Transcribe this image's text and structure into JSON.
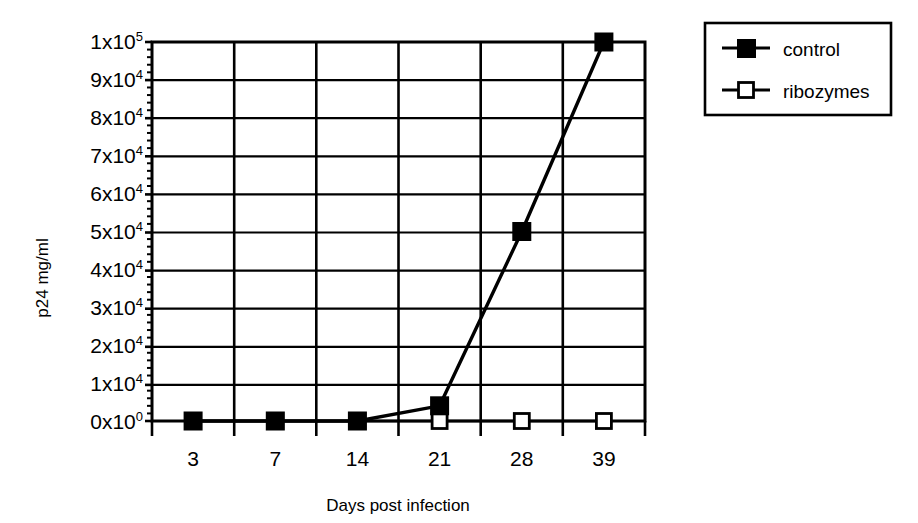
{
  "chart_data": {
    "type": "line",
    "title": "",
    "subtitle": "",
    "xlabel": "Days post infection",
    "ylabel": "p24 mg/ml",
    "categories": [
      "3",
      "7",
      "14",
      "21",
      "28",
      "39"
    ],
    "x": [
      3,
      7,
      14,
      21,
      28,
      39
    ],
    "series": [
      {
        "name": "control",
        "marker": "filled-square",
        "color": "#000000",
        "values": [
          0,
          0,
          0,
          4000,
          50000,
          100000
        ]
      },
      {
        "name": "ribozymes",
        "marker": "open-square",
        "color": "#000000",
        "values": [
          0,
          0,
          0,
          0,
          0,
          0
        ]
      }
    ],
    "ylim": [
      0,
      100000
    ],
    "ytick_values": [
      0,
      10000,
      20000,
      30000,
      40000,
      50000,
      60000,
      70000,
      80000,
      90000,
      100000
    ],
    "ytick_labels": [
      {
        "mantissa": "0x10",
        "exponent": "0"
      },
      {
        "mantissa": "1x10",
        "exponent": "4"
      },
      {
        "mantissa": "2x10",
        "exponent": "4"
      },
      {
        "mantissa": "3x10",
        "exponent": "4"
      },
      {
        "mantissa": "4x10",
        "exponent": "4"
      },
      {
        "mantissa": "5x10",
        "exponent": "4"
      },
      {
        "mantissa": "6x10",
        "exponent": "4"
      },
      {
        "mantissa": "7x10",
        "exponent": "4"
      },
      {
        "mantissa": "8x10",
        "exponent": "4"
      },
      {
        "mantissa": "9x10",
        "exponent": "4"
      },
      {
        "mantissa": "1x10",
        "exponent": "5"
      }
    ],
    "minor_tick_step": 2000,
    "grid": {
      "horizontal": true,
      "vertical": true
    },
    "legend": {
      "position": "top-right-outside",
      "entries": [
        {
          "label": "control",
          "marker": "filled-square"
        },
        {
          "label": "ribozymes",
          "marker": "open-square"
        }
      ]
    }
  },
  "axis": {
    "y_title": "p24 mg/ml",
    "x_title": "Days post infection"
  },
  "legend": {
    "control_label": "control",
    "ribozymes_label": "ribozymes"
  },
  "colors": {
    "ink": "#000000",
    "background": "#ffffff",
    "marker_fill_control": "#000000",
    "marker_fill_ribozymes": "#ffffff"
  }
}
